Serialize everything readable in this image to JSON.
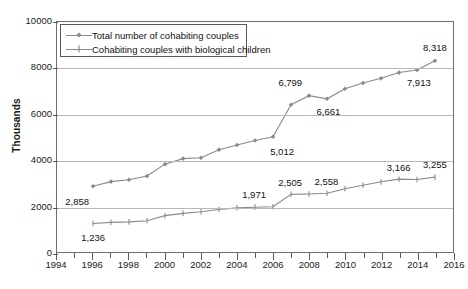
{
  "chart_data": {
    "type": "line",
    "title": "",
    "xlabel": "",
    "ylabel": "Thousands",
    "xlim": [
      1994,
      2016
    ],
    "ylim": [
      0,
      10000
    ],
    "ytick_labels": [
      "10000",
      "8000",
      "6000",
      "4000",
      "2000",
      "0"
    ],
    "ytick_values": [
      10000,
      8000,
      6000,
      4000,
      2000,
      0
    ],
    "xtick_labels": [
      "1994",
      "1996",
      "1998",
      "2000",
      "2002",
      "2004",
      "2006",
      "2008",
      "2010",
      "2012",
      "2014",
      "2016"
    ],
    "xtick_values": [
      1994,
      1996,
      1998,
      2000,
      2002,
      2004,
      2006,
      2008,
      2010,
      2012,
      2014,
      2016
    ],
    "grid": "horizontal",
    "legend_position": "top-left",
    "x": [
      1996,
      1997,
      1998,
      1999,
      2000,
      2001,
      2002,
      2003,
      2004,
      2005,
      2006,
      2007,
      2008,
      2009,
      2010,
      2011,
      2012,
      2013,
      2014,
      2015
    ],
    "series": [
      {
        "name": "Total number of cohabiting couples",
        "marker": "diamond",
        "color": "#8a8a8a",
        "values": [
          2858,
          3060,
          3140,
          3300,
          3820,
          4060,
          4100,
          4450,
          4650,
          4850,
          5012,
          6400,
          6799,
          6661,
          7100,
          7350,
          7550,
          7800,
          7913,
          8318
        ]
      },
      {
        "name": "Cohabiting couples with biological children",
        "marker": "plus",
        "color": "#8a8a8a",
        "values": [
          1236,
          1290,
          1310,
          1360,
          1580,
          1680,
          1750,
          1850,
          1920,
          1950,
          1971,
          2505,
          2520,
          2558,
          2750,
          2900,
          3050,
          3166,
          3150,
          3255
        ]
      }
    ],
    "point_labels": [
      {
        "text": "2,858",
        "x": 1996,
        "series": 0,
        "placement": "below-left"
      },
      {
        "text": "5,012",
        "x": 2006,
        "series": 0,
        "placement": "below-right"
      },
      {
        "text": "6,799",
        "x": 2008,
        "series": 0,
        "placement": "above-left"
      },
      {
        "text": "6,661",
        "x": 2009,
        "series": 0,
        "placement": "below"
      },
      {
        "text": "7,913",
        "x": 2014,
        "series": 0,
        "placement": "below"
      },
      {
        "text": "8,318",
        "x": 2015,
        "series": 0,
        "placement": "above"
      },
      {
        "text": "1,236",
        "x": 1996,
        "series": 1,
        "placement": "below"
      },
      {
        "text": "1,971",
        "x": 2006,
        "series": 1,
        "placement": "above-left"
      },
      {
        "text": "2,505",
        "x": 2007,
        "series": 1,
        "placement": "above"
      },
      {
        "text": "2,558",
        "x": 2009,
        "series": 1,
        "placement": "above"
      },
      {
        "text": "3,166",
        "x": 2013,
        "series": 1,
        "placement": "above"
      },
      {
        "text": "3,255",
        "x": 2015,
        "series": 1,
        "placement": "above"
      }
    ]
  },
  "legend": {
    "items": [
      {
        "label": "Total number of cohabiting couples",
        "marker": "diamond"
      },
      {
        "label": "Cohabiting couples with biological children",
        "marker": "plus"
      }
    ]
  },
  "axes": {
    "y_title": "Thousands"
  }
}
